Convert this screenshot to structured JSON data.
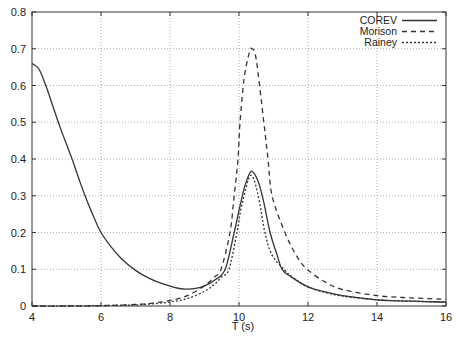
{
  "chart_data": {
    "type": "line",
    "title": "",
    "xlabel": "T  (s)",
    "ylabel": "",
    "xlim": [
      4,
      16
    ],
    "ylim": [
      0,
      0.8
    ],
    "grid": true,
    "legend_position": "top-right",
    "x_ticks": [
      4,
      6,
      8,
      10,
      12,
      14,
      16
    ],
    "y_ticks": [
      0,
      0.1,
      0.2,
      0.3,
      0.4,
      0.5,
      0.6,
      0.7,
      0.8
    ],
    "x_tick_labels": [
      "4",
      "6",
      "8",
      "10",
      "12",
      "14",
      "16"
    ],
    "y_tick_labels": [
      "0",
      "0.1",
      "0.2",
      "0.3",
      "0.4",
      "0.5",
      "0.6",
      "0.7",
      "0.8"
    ],
    "series": [
      {
        "name": "COREV",
        "style": "solid",
        "x": [
          4.0,
          4.2,
          4.4,
          4.6,
          4.8,
          5.0,
          5.2,
          5.4,
          5.6,
          5.8,
          6.0,
          6.3,
          6.6,
          7.0,
          7.4,
          7.8,
          8.2,
          8.45,
          8.7,
          9.0,
          9.3,
          9.6,
          9.86,
          10.0,
          10.15,
          10.3,
          10.4,
          10.55,
          10.7,
          10.9,
          11.1,
          11.25,
          11.5,
          12.0,
          12.5,
          13.0,
          14.0,
          15.0,
          16.0
        ],
        "y": [
          0.66,
          0.645,
          0.6,
          0.545,
          0.49,
          0.44,
          0.39,
          0.335,
          0.285,
          0.24,
          0.2,
          0.16,
          0.128,
          0.097,
          0.075,
          0.06,
          0.049,
          0.046,
          0.047,
          0.055,
          0.071,
          0.1,
          0.2,
          0.26,
          0.32,
          0.36,
          0.365,
          0.34,
          0.29,
          0.2,
          0.14,
          0.1,
          0.08,
          0.052,
          0.038,
          0.028,
          0.017,
          0.013,
          0.011
        ]
      },
      {
        "name": "Morison",
        "style": "dashed",
        "x": [
          4.0,
          5.0,
          6.0,
          7.0,
          7.5,
          8.0,
          8.5,
          9.0,
          9.3,
          9.48,
          9.74,
          9.86,
          9.97,
          10.03,
          10.15,
          10.3,
          10.38,
          10.5,
          10.72,
          10.84,
          10.96,
          11.33,
          11.71,
          12.0,
          12.5,
          13.0,
          14.0,
          15.0,
          16.0
        ],
        "y": [
          0.0,
          0.0,
          0.001,
          0.004,
          0.008,
          0.015,
          0.028,
          0.055,
          0.08,
          0.1,
          0.2,
          0.3,
          0.4,
          0.5,
          0.62,
          0.69,
          0.7,
          0.67,
          0.5,
          0.4,
          0.3,
          0.2,
          0.13,
          0.098,
          0.065,
          0.045,
          0.028,
          0.022,
          0.018
        ]
      },
      {
        "name": "Rainey",
        "style": "dotted",
        "x": [
          4.0,
          5.0,
          6.0,
          7.0,
          7.5,
          8.0,
          8.5,
          9.0,
          9.3,
          9.5,
          9.71,
          9.94,
          10.05,
          10.2,
          10.33,
          10.45,
          10.6,
          10.75,
          10.95,
          11.3,
          11.6,
          12.0,
          12.5,
          13.0,
          14.0,
          15.0,
          16.0
        ],
        "y": [
          0.0,
          0.0,
          0.001,
          0.003,
          0.006,
          0.011,
          0.02,
          0.04,
          0.06,
          0.08,
          0.1,
          0.2,
          0.26,
          0.32,
          0.355,
          0.34,
          0.28,
          0.2,
          0.14,
          0.1,
          0.075,
          0.052,
          0.037,
          0.027,
          0.017,
          0.013,
          0.01
        ]
      }
    ]
  },
  "legend": {
    "entries": [
      "COREV",
      "Morison",
      "Rainey"
    ]
  },
  "colors": {
    "line": "#333333",
    "grid": "#9a9a9a",
    "axis": "#333333"
  }
}
